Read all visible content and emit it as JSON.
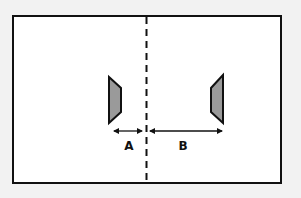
{
  "diagram": {
    "colors": {
      "background": "#f2f2f2",
      "frame_fill": "#ffffff",
      "stroke": "#111111",
      "object_fill": "#9a9a9a"
    },
    "labels": {
      "a": "A",
      "b": "B"
    },
    "dimensions": [
      {
        "name": "A",
        "from": "left-object",
        "to": "center-line"
      },
      {
        "name": "B",
        "from": "center-line",
        "to": "right-object"
      }
    ],
    "objects": [
      {
        "name": "left-object",
        "shape": "trapezoid",
        "side": "left"
      },
      {
        "name": "right-object",
        "shape": "trapezoid",
        "side": "right"
      }
    ]
  }
}
